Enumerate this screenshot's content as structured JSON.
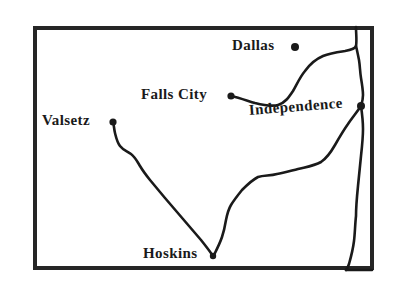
{
  "map": {
    "title": "Road map of Polk County area, Oregon",
    "style": {
      "background_color": "#ffffff",
      "ink_color": "#1a1a1a",
      "border_color": "#262626"
    },
    "frame": {
      "x": 33,
      "y": 26,
      "width": 341,
      "height": 244,
      "stroke_width": 4
    },
    "cities": [
      {
        "id": "dallas",
        "label": "Dallas",
        "label_x": 232,
        "label_y": 38,
        "dot_x": 295,
        "dot_y": 47,
        "dot_r": 4,
        "has_dot": true
      },
      {
        "id": "falls-city",
        "label": "Falls City",
        "label_x": 141,
        "label_y": 87,
        "dot_x": 231,
        "dot_y": 96,
        "dot_r": 3.6,
        "has_dot": true
      },
      {
        "id": "independence",
        "label": "Independence",
        "label_x": 249,
        "label_y": 103,
        "dot_x": 361,
        "dot_y": 106,
        "dot_r": 4,
        "has_dot": true
      },
      {
        "id": "valsetz",
        "label": "Valsetz",
        "label_x": 42,
        "label_y": 113,
        "dot_x": 113,
        "dot_y": 122,
        "dot_r": 3.6,
        "has_dot": true
      },
      {
        "id": "hoskins",
        "label": "Hoskins",
        "label_x": 143,
        "label_y": 246,
        "dot_x": 213,
        "dot_y": 256,
        "dot_r": 3.2,
        "has_dot": true
      }
    ],
    "roads": [
      {
        "id": "falls-city-to-dallas-to-northeast-border",
        "from": "falls-city",
        "to": "north-border-exit",
        "path": "M 231 96 C 240 98 248 101 255 103 C 263 105 271 107 278 105 C 285 103 289 97 293 91 C 297 84 300 77 305 71 C 310 64 316 59 323 56 C 330 53 338 52 345 51 C 351 50 355 49 356 46 C 357 41 356 34 356 27"
      },
      {
        "id": "northeast-border-to-independence",
        "from": "north-border-exit",
        "to": "independence",
        "path": "M 356 46 C 357 50 358 55 359 60 C 360 66 360 72 361 78 C 362 84 363 90 363 95 C 363 100 362 103 361 106"
      },
      {
        "id": "independence-to-hoskins",
        "from": "independence",
        "to": "hoskins",
        "path": "M 361 106 C 357 112 352 118 348 124 C 343 131 339 138 335 145 C 331 152 327 158 321 162 C 314 166 306 167 298 169 C 290 171 283 173 277 174 C 270 176 264 175 258 177 C 252 180 247 185 242 190 C 238 195 234 200 231 205 C 228 210 227 215 226 220 C 225 226 224 231 222 237 C 220 243 217 249 214 255"
      },
      {
        "id": "hoskins-to-valsetz",
        "from": "hoskins",
        "to": "valsetz",
        "path": "M 213 256 C 209 250 205 245 201 240 C 195 233 189 226 183 219 C 177 212 171 205 165 198 C 160 192 155 186 150 180 C 146 175 143 171 140 166 C 137 161 135 157 131 154 C 127 151 123 150 120 146 C 117 142 116 137 115 133 C 114 129 114 125 113 122"
      },
      {
        "id": "independence-south-to-border",
        "from": "independence",
        "to": "south-border-exit",
        "path": "M 361 106 C 362 113 363 121 363 129 C 363 138 362 147 361 156 C 360 166 359 176 358 186 C 357 196 356 206 356 216 C 355 225 355 233 354 241 C 353 249 351 257 349 264 C 348 267 347 269 346 270"
      },
      {
        "id": "south-border-runout",
        "from": "south-border-exit",
        "to": "bottom-right-corner",
        "path": "M 346 270 C 353 270 362 270 372 270"
      }
    ]
  }
}
